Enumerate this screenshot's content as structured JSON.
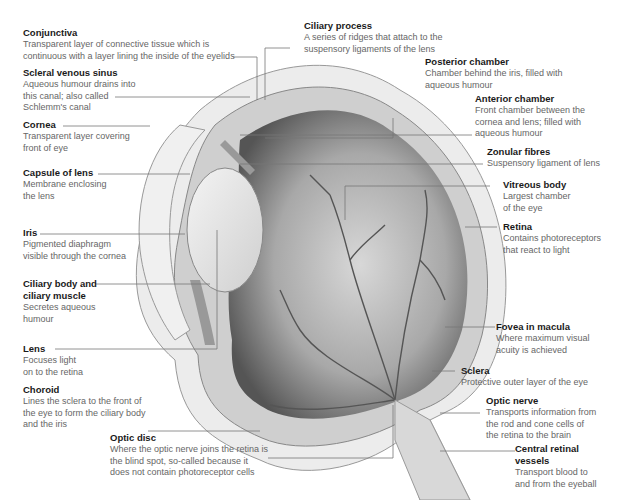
{
  "diagram": {
    "labels": [
      {
        "id": "conjunctiva",
        "title": "Conjunctiva",
        "desc": "Transparent layer of connective tissue which is\ncontinuous with a layer lining the inside of the eyelids"
      },
      {
        "id": "scleral-venous-sinus",
        "title": "Scleral venous sinus",
        "desc": "Aqueous humour drains into\nthis canal; also called\nSchlemm's canal"
      },
      {
        "id": "cornea",
        "title": "Cornea",
        "desc": "Transparent layer covering\nfront of eye"
      },
      {
        "id": "capsule-of-lens",
        "title": "Capsule of lens",
        "desc": "Membrane enclosing\nthe lens"
      },
      {
        "id": "iris",
        "title": "Iris",
        "desc": "Pigmented diaphragm\nvisible through the cornea"
      },
      {
        "id": "ciliary-body",
        "title": "Ciliary body and\nciliary muscle",
        "desc": "Secretes aqueous\nhumour"
      },
      {
        "id": "lens",
        "title": "Lens",
        "desc": "Focuses light\non to the retina"
      },
      {
        "id": "choroid",
        "title": "Choroid",
        "desc": "Lines the sclera to the front of\nthe eye to form the ciliary body\nand the iris"
      },
      {
        "id": "optic-disc",
        "title": "Optic disc",
        "desc": "Where the optic nerve joins the retina is\nthe blind spot, so-called because it\ndoes not contain photoreceptor cells"
      },
      {
        "id": "ciliary-process",
        "title": "Ciliary process",
        "desc": "A series of ridges that attach to the\nsuspensory ligaments of the lens"
      },
      {
        "id": "posterior-chamber",
        "title": "Posterior chamber",
        "desc": "Chamber behind the iris, filled with\naqueous humour"
      },
      {
        "id": "anterior-chamber",
        "title": "Anterior chamber",
        "desc": "Front chamber between the\ncornea and lens; filled with\naqueous humour"
      },
      {
        "id": "zonular-fibres",
        "title": "Zonular fibres",
        "desc": "Suspensory ligament of lens"
      },
      {
        "id": "vitreous-body",
        "title": "Vitreous body",
        "desc": "Largest chamber\nof the eye"
      },
      {
        "id": "retina",
        "title": "Retina",
        "desc": "Contains photoreceptors\nthat react to light"
      },
      {
        "id": "fovea",
        "title": "Fovea in macula",
        "desc": "Where maximum visual\nacuity is achieved"
      },
      {
        "id": "sclera",
        "title": "Sclera",
        "desc": "Protective outer layer of the eye"
      },
      {
        "id": "optic-nerve",
        "title": "Optic nerve",
        "desc": "Transports information from\nthe rod and cone cells of\nthe retina to the brain"
      },
      {
        "id": "central-retinal-vessels",
        "title": "Central retinal\nvessels",
        "desc": "Transport blood to\nand from the eyeball"
      }
    ]
  }
}
